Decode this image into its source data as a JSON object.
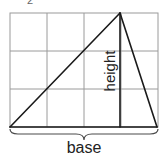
{
  "figure": {
    "partial_label_top": "2",
    "labels": {
      "height": "height",
      "base": "base"
    },
    "grid": {
      "columns": 4,
      "rows": 3,
      "color": "#9a9a9a"
    },
    "triangle": {
      "vertices": [
        {
          "name": "bottom-left",
          "x": 10,
          "y": 127
        },
        {
          "name": "apex",
          "x": 120,
          "y": 13
        },
        {
          "name": "bottom-right",
          "x": 157,
          "y": 127
        }
      ],
      "color": "#1a1a1a"
    }
  }
}
